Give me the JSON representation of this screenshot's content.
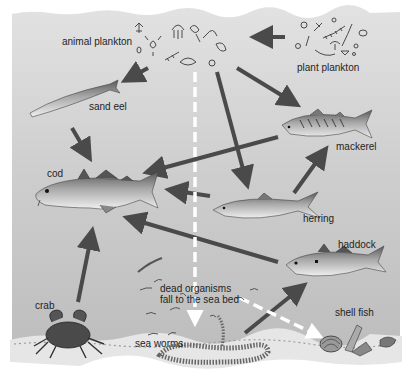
{
  "diagram": {
    "colors": {
      "background_water": "#cfcfcf",
      "arrow": "#4a4a4a",
      "dashed_arrow": "#ffffff",
      "seabed": "#dcdcdc",
      "text": "#1f1f1f"
    },
    "nodes": [
      {
        "id": "animal_plankton",
        "label": "animal plankton"
      },
      {
        "id": "plant_plankton",
        "label": "plant plankton"
      },
      {
        "id": "sand_eel",
        "label": "sand eel"
      },
      {
        "id": "cod",
        "label": "cod"
      },
      {
        "id": "mackerel",
        "label": "mackerel"
      },
      {
        "id": "herring",
        "label": "herring"
      },
      {
        "id": "haddock",
        "label": "haddock"
      },
      {
        "id": "crab",
        "label": "crab"
      },
      {
        "id": "sea_worms",
        "label": "sea worms"
      },
      {
        "id": "shell_fish",
        "label": "shell fish"
      },
      {
        "id": "dead_organisms",
        "label": "dead organisms\nfall to the sea bed"
      }
    ],
    "edges": [
      {
        "from": "plant_plankton",
        "to": "animal_plankton",
        "style": "solid"
      },
      {
        "from": "animal_plankton",
        "to": "sand_eel",
        "style": "solid"
      },
      {
        "from": "animal_plankton",
        "to": "mackerel",
        "style": "solid"
      },
      {
        "from": "animal_plankton",
        "to": "herring",
        "style": "solid"
      },
      {
        "from": "sand_eel",
        "to": "cod",
        "style": "solid"
      },
      {
        "from": "mackerel",
        "to": "cod",
        "style": "solid"
      },
      {
        "from": "herring",
        "to": "cod",
        "style": "solid"
      },
      {
        "from": "herring",
        "to": "mackerel",
        "style": "solid"
      },
      {
        "from": "haddock",
        "to": "cod",
        "style": "solid"
      },
      {
        "from": "crab",
        "to": "cod",
        "style": "solid"
      },
      {
        "from": "sea_worms",
        "to": "haddock",
        "style": "solid"
      },
      {
        "from": "animal_plankton",
        "to": "dead_organisms",
        "style": "dashed"
      },
      {
        "from": "dead_organisms",
        "to": "shell_fish",
        "style": "dashed"
      }
    ]
  }
}
